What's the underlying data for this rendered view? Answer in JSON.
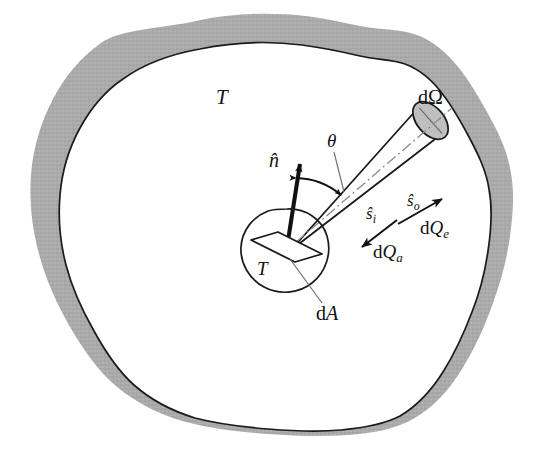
{
  "figure": {
    "name": "radiative-enclosure-diagram",
    "type": "diagram",
    "background_color": "#ffffff",
    "wall_fill_color": "#a9a9a9",
    "wall_stroke_color": "#1a1a1a",
    "interior_fill_color": "#ffffff",
    "cone_fill_color": "#ffffff",
    "cone_cap_fill_color": "#bdbdbd",
    "ink_color": "#111111"
  },
  "labels": {
    "enclosure_temperature": "T",
    "element_temperature": "T",
    "solid_angle": "dΩ",
    "angle_theta": "θ",
    "normal_vector": "n̂",
    "area_element": "dA",
    "incoming_direction": "ŝ",
    "incoming_direction_sub": "i",
    "outgoing_direction": "ŝ",
    "outgoing_direction_sub": "o",
    "absorbed_heat": "dQ",
    "absorbed_heat_sub": "a",
    "emitted_heat": "dQ",
    "emitted_heat_sub": "e"
  },
  "annotations": {
    "normal_vector_desc": "surface normal unit vector at dA",
    "solid_angle_desc": "differential solid angle cone",
    "theta_desc": "polar angle between normal and outgoing ray",
    "area_element_desc": "differential surface area element",
    "incoming_desc": "incident ray direction with absorbed radiative heat",
    "outgoing_desc": "emitted ray direction with emitted radiative heat"
  },
  "geometry": {
    "origin": {
      "x": 287,
      "y": 247
    },
    "cone_axis_end": {
      "x": 432,
      "y": 137
    },
    "normal_tip": {
      "x": 296,
      "y": 155
    },
    "theta_value_deg": 33
  }
}
